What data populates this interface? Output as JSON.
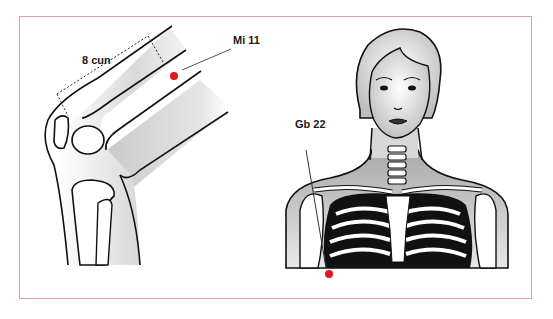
{
  "figure": {
    "frame_color": "#e3a0a3",
    "point_color": "#e0161b",
    "panels": [
      {
        "id": "knee",
        "subject": "flexed knee, lateral view",
        "measurement_label": "8 cun",
        "point_label": "Mi 11"
      },
      {
        "id": "torso",
        "subject": "female head and upper torso with rib cage",
        "point_label": "Gb 22"
      }
    ]
  }
}
